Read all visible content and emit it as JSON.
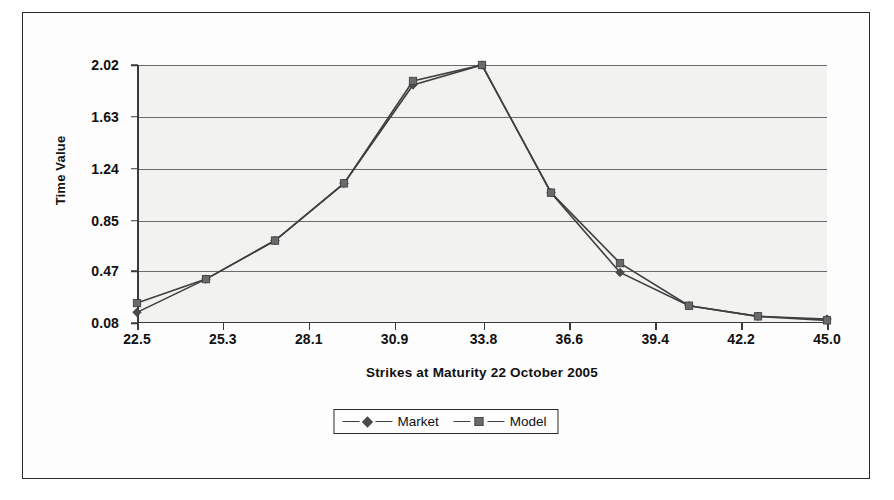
{
  "chart_data": {
    "type": "line",
    "title": "",
    "xlabel": "Strikes at Maturity 22 October 2005",
    "ylabel": "Time Value",
    "x": [
      22.5,
      24.75,
      27.0,
      29.25,
      31.5,
      33.75,
      36.0,
      38.25,
      40.5,
      42.75,
      45.0
    ],
    "xticks": [
      "22.5",
      "25.3",
      "28.1",
      "30.9",
      "33.8",
      "36.6",
      "39.4",
      "42.2",
      "45.0"
    ],
    "xtick_values": [
      22.5,
      25.3,
      28.1,
      30.9,
      33.8,
      36.6,
      39.4,
      42.2,
      45.0
    ],
    "yticks": [
      "0.08",
      "0.47",
      "0.85",
      "1.24",
      "1.63",
      "2.02"
    ],
    "ytick_values": [
      0.08,
      0.47,
      0.85,
      1.24,
      1.63,
      2.02
    ],
    "xlim": [
      22.5,
      45.0
    ],
    "ylim": [
      0.08,
      2.02
    ],
    "grid": true,
    "legend_position": "bottom-center",
    "series": [
      {
        "name": "Market",
        "marker": "diamond",
        "color": "#4a4a4a",
        "values": [
          0.16,
          0.41,
          0.7,
          1.13,
          1.87,
          2.02,
          1.06,
          0.46,
          0.21,
          0.13,
          0.11
        ]
      },
      {
        "name": "Model",
        "marker": "square",
        "color": "#6a6a6a",
        "values": [
          0.23,
          0.41,
          0.7,
          1.13,
          1.9,
          2.02,
          1.06,
          0.53,
          0.21,
          0.13,
          0.1
        ]
      }
    ]
  },
  "legend": {
    "items": [
      {
        "label": "Market",
        "marker": "diamond"
      },
      {
        "label": "Model",
        "marker": "square"
      }
    ]
  },
  "colors": {
    "plot_background": "#f2f2f0",
    "gridline": "#6b6b6b",
    "axis": "#3a3a3a",
    "frame": "#2a2a2a",
    "text": "#111111"
  }
}
